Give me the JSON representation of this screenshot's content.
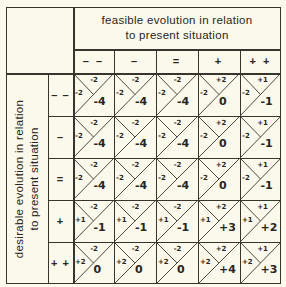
{
  "column_title": "feasible evolution in relation to present situation",
  "column_title_lines": [
    "feasible evolution in relation",
    "to present situation"
  ],
  "row_title": "desirable evolution in relation to present situation",
  "row_title_lines": [
    "desirable evolution in relation",
    "to present situation"
  ],
  "columns": [
    "– –",
    "–",
    "=",
    "+",
    "+ +"
  ],
  "rows": [
    "– –",
    "–",
    "=",
    "+",
    "+ +"
  ],
  "cells": [
    [
      {
        "top": "-2",
        "left": "-2",
        "result": "-4"
      },
      {
        "top": "-2",
        "left": "-2",
        "result": "-4"
      },
      {
        "top": "-2",
        "left": "-2",
        "result": "-4"
      },
      {
        "top": "+2",
        "left": "-2",
        "result": "0"
      },
      {
        "top": "+1",
        "left": "-2",
        "result": "-1"
      }
    ],
    [
      {
        "top": "-2",
        "left": "-2",
        "result": "-4"
      },
      {
        "top": "-2",
        "left": "-2",
        "result": "-4"
      },
      {
        "top": "-2",
        "left": "-2",
        "result": "-4"
      },
      {
        "top": "+2",
        "left": "-2",
        "result": "0"
      },
      {
        "top": "+1",
        "left": "-2",
        "result": "-1"
      }
    ],
    [
      {
        "top": "-2",
        "left": "-2",
        "result": "-4"
      },
      {
        "top": "-2",
        "left": "-2",
        "result": "-4"
      },
      {
        "top": "-2",
        "left": "-2",
        "result": "-4"
      },
      {
        "top": "+2",
        "left": "-2",
        "result": "0"
      },
      {
        "top": "+1",
        "left": "-2",
        "result": "-1"
      }
    ],
    [
      {
        "top": "-2",
        "left": "+1",
        "result": "-1"
      },
      {
        "top": "-2",
        "left": "+1",
        "result": "-1"
      },
      {
        "top": "-2",
        "left": "+1",
        "result": "-1"
      },
      {
        "top": "+2",
        "left": "+1",
        "result": "+3"
      },
      {
        "top": "+1",
        "left": "+1",
        "result": "+2"
      }
    ],
    [
      {
        "top": "-2",
        "left": "+2",
        "result": "0"
      },
      {
        "top": "-2",
        "left": "+2",
        "result": "0"
      },
      {
        "top": "-2",
        "left": "+2",
        "result": "0"
      },
      {
        "top": "+2",
        "left": "+2",
        "result": "+4"
      },
      {
        "top": "+1",
        "left": "+2",
        "result": "+3"
      }
    ]
  ],
  "colors": {
    "background": "#fbf9ec",
    "lines": "#3a342e",
    "text": "#2a2520"
  }
}
